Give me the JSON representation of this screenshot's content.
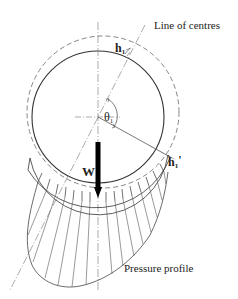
{
  "diagram": {
    "labels": {
      "line_of_centres": "Line of centres",
      "h1": "h",
      "h1_sub": "1",
      "h1_prime": "h",
      "h1_prime_sub": "1",
      "h1_prime_mark": "'",
      "theta": "θ",
      "theta_sub": "1",
      "load": "W",
      "pressure_profile": "Pressure profile"
    },
    "colors": {
      "line": "#444444",
      "dash": "#777777",
      "arrow": "#000000",
      "background": "#ffffff"
    },
    "geometry": {
      "journal_center": [
        98,
        117
      ],
      "journal_radius": 66,
      "bearing_center": [
        103,
        112
      ],
      "bearing_radius": 76
    }
  }
}
